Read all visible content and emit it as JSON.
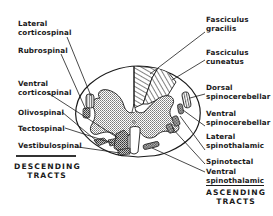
{
  "diagram": {
    "colors": {
      "ink": "#1a1a1a",
      "background": "#ffffff",
      "stipple": "#9a9a9a"
    },
    "descending": {
      "heading_line1": "DESCENDING",
      "heading_line2": "TRACTS",
      "labels": {
        "lateral_corticospinal_1": "Lateral",
        "lateral_corticospinal_2": "corticospinal",
        "rubrospinal": "Rubrospinal",
        "ventral_corticospinal_1": "Ventral",
        "ventral_corticospinal_2": "corticospinal",
        "olivospinal": "Olivospinal",
        "tectospinal": "Tectospinal",
        "vestibulospinal": "Vestibulospinal"
      }
    },
    "ascending": {
      "heading_line1": "ASCENDING",
      "heading_line2": "TRACTS",
      "labels": {
        "fasciculus_gracilis_1": "Fasciculus",
        "fasciculus_gracilis_2": "gracilis",
        "fasciculus_cuneatus_1": "Fasciculus",
        "fasciculus_cuneatus_2": "cuneatus",
        "dorsal_spinocerebellar_1": "Dorsal",
        "dorsal_spinocerebellar_2": "spinocerebellar",
        "ventral_spinocerebellar_1": "Ventral",
        "ventral_spinocerebellar_2": "spinocerebellar",
        "lateral_spinothalamic_1": "Lateral",
        "lateral_spinothalamic_2": "spinothalamic",
        "spinotectal": "Spinotectal",
        "ventral_spinothalamic_1": "Ventral",
        "ventral_spinothalamic_2": "spinothalamic"
      }
    }
  }
}
